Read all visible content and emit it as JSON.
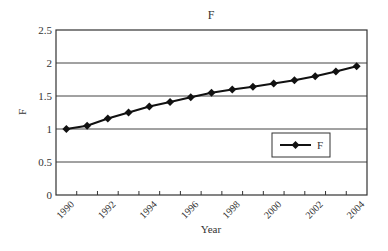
{
  "chart_data": {
    "type": "line",
    "title": "F",
    "xlabel": "Year",
    "ylabel": "F",
    "x": [
      1990,
      1991,
      1992,
      1993,
      1994,
      1995,
      1996,
      1997,
      1998,
      1999,
      2000,
      2001,
      2002,
      2003,
      2004
    ],
    "series": [
      {
        "name": "F",
        "marker": "diamond",
        "color": "#111111",
        "values": [
          1.0,
          1.05,
          1.16,
          1.25,
          1.34,
          1.41,
          1.48,
          1.55,
          1.6,
          1.64,
          1.69,
          1.74,
          1.8,
          1.87,
          1.95
        ]
      }
    ],
    "ylim": [
      0,
      2.5
    ],
    "yticks": [
      "0",
      "0.5",
      "1",
      "1.5",
      "2",
      "2.5"
    ],
    "xtick_labels": [
      "1990",
      "1992",
      "1994",
      "1996",
      "1998",
      "2000",
      "2002",
      "2004"
    ],
    "grid": "horizontal",
    "legend": {
      "position": "inside-right",
      "entries": [
        "F"
      ]
    }
  }
}
